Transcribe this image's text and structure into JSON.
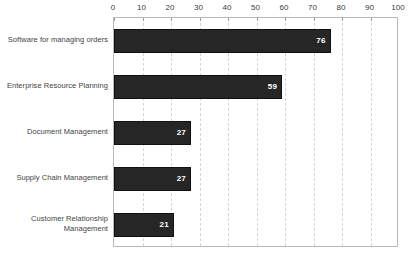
{
  "chart_data": {
    "type": "bar",
    "orientation": "horizontal",
    "title": "",
    "subtitle": "",
    "xlabel": "",
    "ylabel": "",
    "xlim": [
      0,
      100
    ],
    "xticks": [
      0,
      10,
      20,
      30,
      40,
      50,
      60,
      70,
      80,
      90,
      100
    ],
    "xtick_labels": [
      "0",
      "10",
      "20",
      "30",
      "40",
      "50",
      "60",
      "70",
      "80",
      "90",
      "100"
    ],
    "grid": true,
    "grid_axis": "x",
    "grid_style": "dashed",
    "legend": false,
    "categories": [
      "Software for managing orders",
      "Enterprise Resource Planning",
      "Document Management",
      "Supply Chain Management",
      "Customer Relationship Management"
    ],
    "values": [
      76,
      59,
      27,
      27,
      21
    ],
    "value_labels": [
      "76",
      "59",
      "27",
      "27",
      "21"
    ],
    "bar_color": "#262626",
    "bar_edge_color": "#111111",
    "value_label_color": "#ffffff",
    "axis_color": "#b9b9b9",
    "grid_color": "#d6d6d6",
    "tick_label_color": "#3b3b3b",
    "category_label_color": "#444444",
    "background_color": "#ffffff"
  }
}
